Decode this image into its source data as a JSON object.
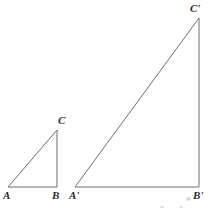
{
  "figure": {
    "background_color": "#ffffff",
    "stroke_color": "#6e6e6e",
    "label_color": "#2b2b2b",
    "stroke_width": 1,
    "width": 217,
    "height": 211
  },
  "triangles": [
    {
      "name": "small-triangle",
      "id": "ABC",
      "vertices": [
        {
          "label": "A",
          "x": 8,
          "y": 187,
          "label_x": 3,
          "label_y": 190
        },
        {
          "label": "B",
          "x": 57,
          "y": 187,
          "label_x": 52,
          "label_y": 190
        },
        {
          "label": "C",
          "x": 57,
          "y": 130,
          "label_x": 58,
          "label_y": 115
        }
      ],
      "base_length": 49,
      "height_length": 57,
      "right_angle_at": "B"
    },
    {
      "name": "large-triangle",
      "id": "A'B'C'",
      "vertices": [
        {
          "label": "A'",
          "x": 75,
          "y": 187,
          "label_x": 69,
          "label_y": 190
        },
        {
          "label": "B'",
          "x": 199,
          "y": 187,
          "label_x": 193,
          "label_y": 190
        },
        {
          "label": "C'",
          "x": 199,
          "y": 18,
          "label_x": 190,
          "label_y": 3
        }
      ],
      "base_length": 124,
      "height_length": 169,
      "right_angle_at": "B'"
    }
  ],
  "labels": {
    "a": "A",
    "b": "B",
    "c": "C",
    "a_prime": "A'",
    "b_prime": "B'",
    "c_prime": "C'"
  },
  "artifacts": [
    {
      "x": 186,
      "y": 197,
      "w": 5,
      "h": 4
    },
    {
      "x": 160,
      "y": 206,
      "w": 4,
      "h": 2
    },
    {
      "x": 179,
      "y": 206,
      "w": 4,
      "h": 2
    }
  ]
}
